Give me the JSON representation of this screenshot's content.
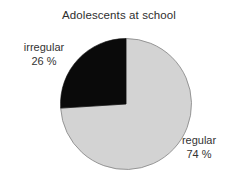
{
  "chart_data": {
    "type": "pie",
    "title": "Adolescents at school",
    "categories": [
      "regular",
      "irregular"
    ],
    "values": [
      74,
      26
    ],
    "unit": "%",
    "labels": [
      {
        "name": "regular",
        "value": "74 %",
        "percent": 74,
        "color": "#d3d3d3",
        "position": "bottom-right"
      },
      {
        "name": "irregular",
        "value": "26 %",
        "percent": 26,
        "color": "#0a0a0a",
        "position": "top-left"
      }
    ],
    "legend": "none",
    "grid": false,
    "xlabel": "",
    "ylabel": "",
    "start_angle_deg": 90,
    "direction": "counterclockwise"
  },
  "chart": {
    "title": "Adolescents at school",
    "background": "#ffffff",
    "outline_color": "#8c8c8c",
    "center_x": 126,
    "center_y": 104,
    "radius": 65.5
  },
  "slices": {
    "irregular": {
      "name": "irregular",
      "percent_label": "26 %",
      "color": "#0a0a0a"
    },
    "regular": {
      "name": "regular",
      "percent_label": "74 %",
      "color": "#d3d3d3"
    }
  }
}
